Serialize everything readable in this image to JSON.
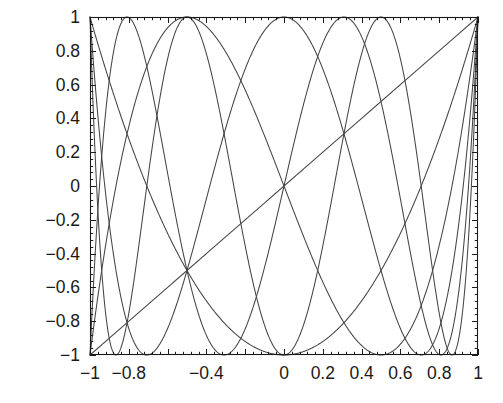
{
  "chart_data": {
    "type": "line",
    "title": "",
    "subtitle": "",
    "xlabel": "",
    "ylabel": "",
    "xlim": [
      -1,
      1
    ],
    "ylim": [
      -1,
      1
    ],
    "grid": false,
    "legend": "none",
    "line_color": "#444444",
    "axis_color": "#1a1a1a",
    "background": "#ffffff",
    "x_ticks_major": [
      -1,
      -0.8,
      -0.6,
      -0.4,
      -0.2,
      0,
      0.2,
      0.4,
      0.6,
      0.8,
      1
    ],
    "x_tick_labels": [
      "-1",
      "-0.8",
      "",
      "-0.4",
      "",
      "0",
      "0.2",
      "0.4",
      "0.6",
      "0.8",
      "1"
    ],
    "x_tick_labels_shown": [
      "-1",
      "-0.8",
      "-0.4",
      "0",
      "0.2",
      "0.4",
      "0.6",
      "0.8",
      "1"
    ],
    "y_ticks_major": [
      -1,
      -0.8,
      -0.6,
      -0.4,
      -0.2,
      0,
      0.2,
      0.4,
      0.6,
      0.8,
      1
    ],
    "y_tick_labels": [
      "-1",
      "-0.8",
      "-0.6",
      "-0.4",
      "-0.2",
      "0",
      "0.2",
      "0.4",
      "0.6",
      "0.8",
      "1"
    ],
    "minor_ticks_per_major": 5,
    "series": [
      {
        "name": "T1",
        "degree": 1,
        "endpoint_left": -1,
        "endpoint_right": 1,
        "extrema_count": 2
      },
      {
        "name": "T2",
        "degree": 2,
        "endpoint_left": 1,
        "endpoint_right": 1,
        "extrema_count": 3
      },
      {
        "name": "T3",
        "degree": 3,
        "endpoint_left": -1,
        "endpoint_right": 1,
        "extrema_count": 4
      },
      {
        "name": "T4",
        "degree": 4,
        "endpoint_left": 1,
        "endpoint_right": 1,
        "extrema_count": 5
      },
      {
        "name": "T5",
        "degree": 5,
        "endpoint_left": -1,
        "endpoint_right": 1,
        "extrema_count": 6
      },
      {
        "name": "T6",
        "degree": 6,
        "endpoint_left": 1,
        "endpoint_right": 1,
        "extrema_count": 7
      }
    ]
  },
  "plot_box": {
    "left": 90,
    "top": 17,
    "right": 478,
    "bottom": 355
  }
}
